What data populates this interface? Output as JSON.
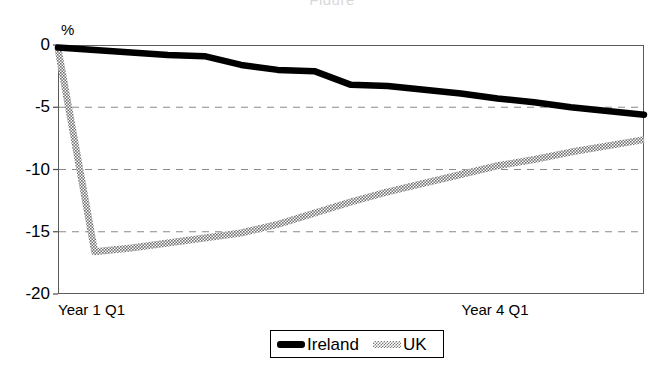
{
  "title_faint": "Figure",
  "axis": {
    "y_unit_label": "%",
    "y_ticks": [
      {
        "label": "0",
        "value": 0
      },
      {
        "label": "-5",
        "value": -5
      },
      {
        "label": "-10",
        "value": -10
      },
      {
        "label": "-15",
        "value": -15
      },
      {
        "label": "-20",
        "value": -20
      }
    ],
    "x_ticks": [
      {
        "label": "Year 1 Q1",
        "value": 0
      },
      {
        "label": "Year 4 Q1",
        "value": 12
      }
    ]
  },
  "legend": {
    "position": "bottom-center",
    "entries": [
      {
        "label": "Ireland",
        "icon": "solid-line-swatch",
        "color": "#000000"
      },
      {
        "label": "UK",
        "icon": "hatched-line-swatch",
        "color": "#7a7a7a"
      }
    ]
  },
  "chart_data": {
    "type": "line",
    "title": "",
    "subtitle": "",
    "xlabel": "",
    "ylabel": "%",
    "ylim": [
      -20,
      0
    ],
    "xlim": [
      0,
      16
    ],
    "grid": "horizontal-dashed",
    "gridlines": [
      -5,
      -10,
      -15
    ],
    "x_tick_labels": [
      "Year 1 Q1",
      "Year 4 Q1"
    ],
    "x_tick_values": [
      0,
      12
    ],
    "series": [
      {
        "name": "Ireland",
        "color": "#000000",
        "style": "solid-thick",
        "x": [
          0,
          1,
          2,
          3,
          4,
          5,
          6,
          7,
          8,
          9,
          10,
          11,
          12,
          13,
          14,
          15,
          16
        ],
        "values": [
          -0.2,
          -0.4,
          -0.6,
          -0.8,
          -0.9,
          -1.6,
          -2.0,
          -2.1,
          -3.2,
          -3.3,
          -3.6,
          -3.9,
          -4.3,
          -4.6,
          -5.0,
          -5.3,
          -5.6
        ]
      },
      {
        "name": "UK",
        "color": "#7a7a7a",
        "style": "hatched-thick",
        "x": [
          0,
          1,
          2,
          3,
          4,
          5,
          6,
          7,
          8,
          9,
          10,
          11,
          12,
          13,
          14,
          15,
          16
        ],
        "values": [
          -0.3,
          -16.6,
          -16.3,
          -15.9,
          -15.5,
          -15.1,
          -14.4,
          -13.5,
          -12.6,
          -11.8,
          -11.1,
          -10.4,
          -9.7,
          -9.2,
          -8.6,
          -8.1,
          -7.6
        ]
      }
    ],
    "annotations": []
  }
}
